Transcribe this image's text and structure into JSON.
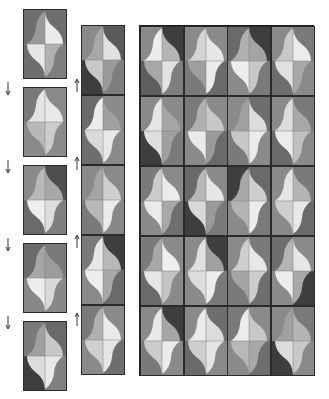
{
  "diagram": {
    "title": "",
    "colors": {
      "dark": "#4a4a4a",
      "mid_dark": "#6e6e6e",
      "mid": "#8e8e8e",
      "light": "#c4c4c4",
      "lighter": "#dedede",
      "lightest": "#f0f0f0",
      "border": "#222222"
    },
    "left_strip": {
      "tiles": [
        {
          "bg": [
            "#6e6e6e",
            "#6e6e6e",
            "#6e6e6e",
            "#7e7e7e"
          ],
          "q": [
            "#9a9a9a",
            "#ebebeb",
            "#e6e6e6",
            "#b0b0b0"
          ]
        },
        {
          "bg": [
            "#7a7a7a",
            "#8a8a8a",
            "#8a8a8a",
            "#8a8a8a"
          ],
          "q": [
            "#e3e3e3",
            "#e8e8e8",
            "#b8b8b8",
            "#cccccc"
          ]
        },
        {
          "bg": [
            "#8a8a8a",
            "#4e4e4e",
            "#6a6a6a",
            "#7e7e7e"
          ],
          "q": [
            "#b8b8b8",
            "#a8a8a8",
            "#eeeeee",
            "#dcdcdc"
          ]
        },
        {
          "bg": [
            "#6a6a6a",
            "#7a7a7a",
            "#888888",
            "#888888"
          ],
          "q": [
            "#a6a6a6",
            "#9c9c9c",
            "#ededed",
            "#d8d8d8"
          ]
        },
        {
          "bg": [
            "#7a7a7a",
            "#6a6a6a",
            "#3e3e3e",
            "#808080"
          ],
          "q": [
            "#a0a0a0",
            "#c8c8c8",
            "#dcdcdc",
            "#e8e8e8"
          ]
        }
      ],
      "down_arrows": 4,
      "up_arrows": 4
    },
    "middle_strip": {
      "tiles": [
        {
          "bg": [
            "#8a8a8a",
            "#5a5a5a",
            "#3e3e3e",
            "#7e7e7e"
          ],
          "q": [
            "#a8a8a8",
            "#e0e0e0",
            "#c8c8c8",
            "#9a9a9a"
          ]
        },
        {
          "bg": [
            "#6a6a6a",
            "#8a8a8a",
            "#6e6e6e",
            "#8a8a8a"
          ],
          "q": [
            "#ececec",
            "#a0a0a0",
            "#dadada",
            "#e8e8e8"
          ]
        },
        {
          "bg": [
            "#8a8a8a",
            "#8a8a8a",
            "#7a7a7a",
            "#888888"
          ],
          "q": [
            "#a4a4a4",
            "#cfcfcf",
            "#b8b8b8",
            "#ebebeb"
          ]
        },
        {
          "bg": [
            "#7a7a7a",
            "#3e3e3e",
            "#8a8a8a",
            "#6a6a6a"
          ],
          "q": [
            "#e8e8e8",
            "#b8b8b8",
            "#eeeeee",
            "#a8a8a8"
          ]
        },
        {
          "bg": [
            "#7a7a7a",
            "#8a8a8a",
            "#8a8a8a",
            "#6e6e6e"
          ],
          "q": [
            "#b0b0b0",
            "#eaeaea",
            "#cfcfcf",
            "#e6e6e6"
          ]
        }
      ],
      "up_arrows": 4
    },
    "main_grid": {
      "rows": 5,
      "cols": 4,
      "tiles": [
        [
          {
            "bg": [
              "#8a8a8a",
              "#3e3e3e",
              "#5e5e5e",
              "#7e7e7e"
            ],
            "q": [
              "#ececec",
              "#b4b4b4",
              "#a8a8a8",
              "#e2e2e2"
            ]
          },
          {
            "bg": [
              "#8a8a8a",
              "#8a8a8a",
              "#7a7a7a",
              "#6a6a6a"
            ],
            "q": [
              "#d4d4d4",
              "#e6e6e6",
              "#9e9e9e",
              "#ebebeb"
            ]
          },
          {
            "bg": [
              "#6a6a6a",
              "#3e3e3e",
              "#8a8a8a",
              "#7a7a7a"
            ],
            "q": [
              "#b0b0b0",
              "#a4a4a4",
              "#ededed",
              "#c8c8c8"
            ]
          },
          {
            "bg": [
              "#8a8a8a",
              "#7a7a7a",
              "#6e6e6e",
              "#8a8a8a"
            ],
            "q": [
              "#c8c8c8",
              "#ececec",
              "#e0e0e0",
              "#a8a8a8"
            ]
          }
        ],
        [
          {
            "bg": [
              "#8a8a8a",
              "#8a8a8a",
              "#3e3e3e",
              "#7a7a7a"
            ],
            "q": [
              "#e6e6e6",
              "#a6a6a6",
              "#dedede",
              "#a0a0a0"
            ]
          },
          {
            "bg": [
              "#7a7a7a",
              "#8a8a8a",
              "#8a8a8a",
              "#6a6a6a"
            ],
            "q": [
              "#b0b0b0",
              "#c8c8c8",
              "#eaeaea",
              "#9a9a9a"
            ]
          },
          {
            "bg": [
              "#8a8a8a",
              "#6e6e6e",
              "#7a7a7a",
              "#8a8a8a"
            ],
            "q": [
              "#a0a0a0",
              "#dcdcdc",
              "#c8c8c8",
              "#ebebeb"
            ]
          },
          {
            "bg": [
              "#8a8a8a",
              "#7a7a7a",
              "#6a6a6a",
              "#8a8a8a"
            ],
            "q": [
              "#dcdcdc",
              "#a8a8a8",
              "#ececec",
              "#c0c0c0"
            ]
          }
        ],
        [
          {
            "bg": [
              "#7a7a7a",
              "#8a8a8a",
              "#8a8a8a",
              "#6e6e6e"
            ],
            "q": [
              "#cccccc",
              "#ececec",
              "#eaeaea",
              "#a8a8a8"
            ]
          },
          {
            "bg": [
              "#6a6a6a",
              "#8a8a8a",
              "#3e3e3e",
              "#7a7a7a"
            ],
            "q": [
              "#b8b8b8",
              "#e6e6e6",
              "#d8d8d8",
              "#9a9a9a"
            ]
          },
          {
            "bg": [
              "#3e3e3e",
              "#6a6a6a",
              "#8a8a8a",
              "#7a7a7a"
            ],
            "q": [
              "#a8a8a8",
              "#cfcfcf",
              "#b4b4b4",
              "#ececec"
            ]
          },
          {
            "bg": [
              "#8a8a8a",
              "#7a7a7a",
              "#8a8a8a",
              "#6a6a6a"
            ],
            "q": [
              "#e4e4e4",
              "#b4b4b4",
              "#cfcfcf",
              "#e8e8e8"
            ]
          }
        ],
        [
          {
            "bg": [
              "#7a7a7a",
              "#8a8a8a",
              "#6a6a6a",
              "#8a8a8a"
            ],
            "q": [
              "#a8a8a8",
              "#eeeeee",
              "#e6e6e6",
              "#c4c4c4"
            ]
          },
          {
            "bg": [
              "#8a8a8a",
              "#3e3e3e",
              "#8a8a8a",
              "#7a7a7a"
            ],
            "q": [
              "#e0e0e0",
              "#a0a0a0",
              "#dcdcdc",
              "#ececec"
            ]
          },
          {
            "bg": [
              "#8a8a8a",
              "#7a7a7a",
              "#7a7a7a",
              "#6e6e6e"
            ],
            "q": [
              "#cfcfcf",
              "#e8e8e8",
              "#a4a4a4",
              "#cccccc"
            ]
          },
          {
            "bg": [
              "#6e6e6e",
              "#8a8a8a",
              "#8a8a8a",
              "#3e3e3e"
            ],
            "q": [
              "#b4b4b4",
              "#e6e6e6",
              "#ececec",
              "#a8a8a8"
            ]
          }
        ],
        [
          {
            "bg": [
              "#8a8a8a",
              "#3e3e3e",
              "#7a7a7a",
              "#8a8a8a"
            ],
            "q": [
              "#e8e8e8",
              "#a6a6a6",
              "#cccccc",
              "#ececec"
            ]
          },
          {
            "bg": [
              "#8a8a8a",
              "#6e6e6e",
              "#6a6a6a",
              "#8a8a8a"
            ],
            "q": [
              "#ebebeb",
              "#dcdcdc",
              "#cfcfcf",
              "#e4e4e4"
            ]
          },
          {
            "bg": [
              "#7a7a7a",
              "#8a8a8a",
              "#8a8a8a",
              "#6e6e6e"
            ],
            "q": [
              "#ececec",
              "#c8c8c8",
              "#b8b8b8",
              "#a8a8a8"
            ]
          },
          {
            "bg": [
              "#8a8a8a",
              "#7a7a7a",
              "#3e3e3e",
              "#8a8a8a"
            ],
            "q": [
              "#a0a0a0",
              "#b4b4b4",
              "#dcdcdc",
              "#c8c8c8"
            ]
          }
        ]
      ]
    }
  }
}
